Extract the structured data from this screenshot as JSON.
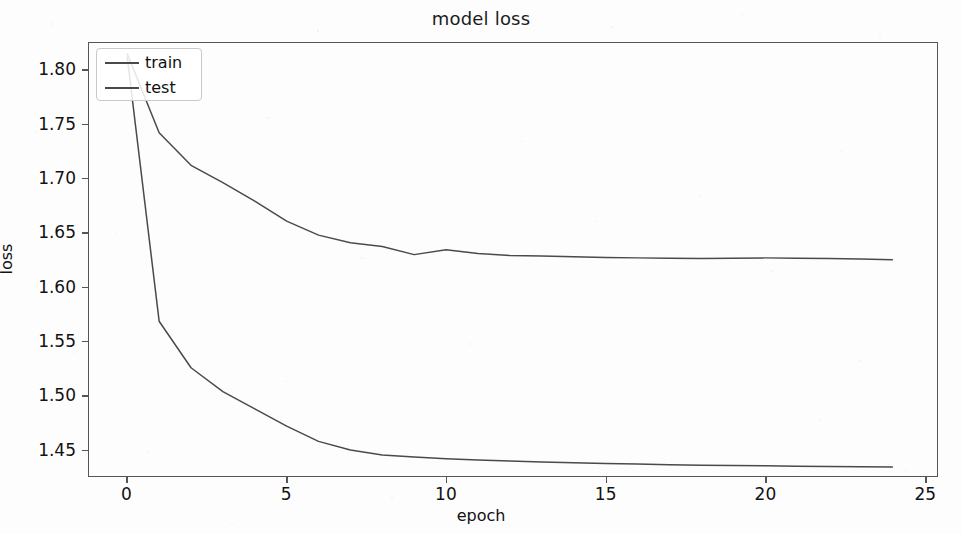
{
  "chart_data": {
    "type": "line",
    "title": "model loss",
    "xlabel": "epoch",
    "ylabel": "loss",
    "xlim": [
      -1.2,
      25.4
    ],
    "ylim": [
      1.425,
      1.825
    ],
    "xticks": [
      "0",
      "5",
      "10",
      "15",
      "20",
      "25"
    ],
    "xtick_values": [
      0,
      5,
      10,
      15,
      20,
      25
    ],
    "yticks": [
      "1.45",
      "1.50",
      "1.55",
      "1.60",
      "1.65",
      "1.70",
      "1.75",
      "1.80"
    ],
    "ytick_values": [
      1.45,
      1.5,
      1.55,
      1.6,
      1.65,
      1.7,
      1.75,
      1.8
    ],
    "grid": false,
    "legend_position": "upper left",
    "x": [
      0,
      1,
      2,
      3,
      4,
      5,
      6,
      7,
      8,
      9,
      10,
      11,
      12,
      13,
      14,
      15,
      16,
      17,
      18,
      19,
      20,
      21,
      22,
      23,
      24
    ],
    "series": [
      {
        "name": "train",
        "color": "#4a4a4a",
        "values": [
          1.812,
          1.568,
          1.525,
          1.503,
          1.487,
          1.471,
          1.457,
          1.449,
          1.4445,
          1.4425,
          1.441,
          1.4398,
          1.4388,
          1.438,
          1.4372,
          1.4365,
          1.436,
          1.4355,
          1.435,
          1.4347,
          1.4344,
          1.4341,
          1.4338,
          1.4336,
          1.4334
        ]
      },
      {
        "name": "test",
        "color": "#4a4a4a",
        "values": [
          1.815,
          1.742,
          1.712,
          1.696,
          1.679,
          1.6605,
          1.6475,
          1.6405,
          1.637,
          1.6295,
          1.634,
          1.6305,
          1.6288,
          1.6282,
          1.6275,
          1.6268,
          1.6265,
          1.6262,
          1.626,
          1.6262,
          1.6265,
          1.6262,
          1.626,
          1.6255,
          1.6247
        ]
      }
    ]
  },
  "legend": {
    "items": [
      {
        "label": "train"
      },
      {
        "label": "test"
      }
    ]
  }
}
